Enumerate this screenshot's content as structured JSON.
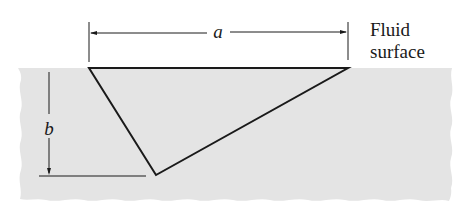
{
  "diagram": {
    "colors": {
      "background": "#ffffff",
      "fluid": "#e4e4e4",
      "line": "#1a1a1a",
      "text": "#1a1a1a"
    },
    "labels": {
      "surface_line1": "Fluid",
      "surface_line2": "surface",
      "dimension_a": "a",
      "dimension_b": "b"
    },
    "triangle": {
      "vertices": [
        [
          89,
          68
        ],
        [
          348,
          68
        ],
        [
          156,
          175
        ]
      ]
    }
  }
}
